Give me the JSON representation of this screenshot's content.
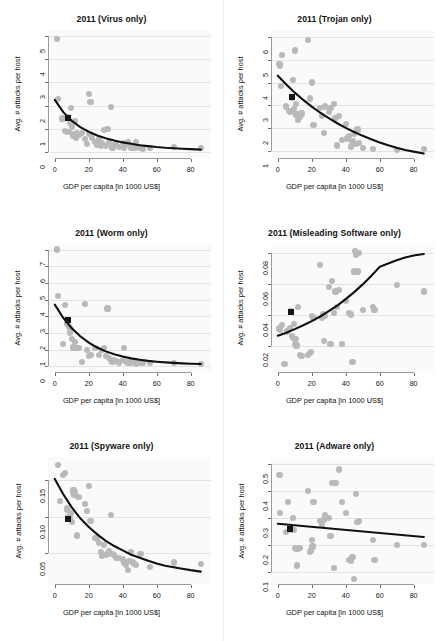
{
  "figure": {
    "rows": 3,
    "cols": 2,
    "point_color": "#b9b9b9",
    "fit_color": "#111111",
    "marker_color": "#161616",
    "grid_color": "#e3e3e3",
    "panel_bg": "#fafafa"
  },
  "common": {
    "xlabel": "GDP per capita [in 1000 US$]",
    "ylabel": "Avg. # attacks per host",
    "xticks": [
      0,
      20,
      40,
      60,
      80
    ],
    "xlim": [
      -4,
      92
    ]
  },
  "chart_data": [
    {
      "type": "scatter",
      "title": "2011 (Virus only)",
      "xlabel": "GDP per capita [in 1000 US$]",
      "ylabel": "Avg. # attacks per host",
      "xlim": [
        -4,
        92
      ],
      "ylim": [
        -0.25,
        5.25
      ],
      "xticks": [
        0,
        20,
        40,
        60,
        80
      ],
      "yticks": [
        0,
        1,
        2,
        3,
        4,
        5
      ],
      "ytick_labels": [
        "0",
        "1",
        "2",
        "3",
        "4",
        "5"
      ],
      "grid": true,
      "legend": "none",
      "x": [
        1.5,
        2.0,
        4.5,
        6.0,
        7.0,
        8.0,
        8.5,
        9.0,
        9.5,
        10.0,
        10.5,
        11.0,
        12.0,
        12.5,
        13.0,
        14.0,
        16.0,
        18.0,
        19.0,
        20.0,
        20.5,
        21.0,
        22.0,
        24.0,
        25.0,
        26.0,
        27.0,
        28.0,
        29.0,
        30.0,
        31.0,
        32.0,
        33.0,
        34.0,
        35.0,
        36.0,
        38.0,
        40.0,
        41.0,
        42.0,
        43.0,
        44.0,
        45.0,
        46.0,
        47.0,
        48.0,
        49.0,
        50.0,
        52.0,
        56.0,
        70.0,
        86.0
      ],
      "y": [
        4.85,
        2.3,
        1.45,
        0.9,
        0.85,
        1.5,
        0.88,
        1.25,
        1.9,
        1.1,
        0.78,
        0.72,
        1.35,
        0.6,
        0.8,
        0.75,
        0.82,
        0.55,
        0.35,
        2.5,
        0.78,
        2.15,
        0.6,
        0.45,
        0.32,
        0.55,
        0.28,
        0.38,
        0.95,
        0.25,
        1.0,
        0.42,
        1.95,
        0.2,
        0.3,
        0.35,
        0.22,
        0.4,
        0.18,
        0.35,
        0.42,
        0.3,
        0.2,
        0.25,
        0.18,
        0.45,
        0.22,
        0.2,
        0.15,
        0.18,
        0.22,
        0.18
      ],
      "marker_point": {
        "x": 8.0,
        "y": 1.45
      },
      "fit_type": "exponential_decay",
      "fit_points": [
        [
          0,
          2.25
        ],
        [
          5,
          1.72
        ],
        [
          10,
          1.35
        ],
        [
          15,
          1.08
        ],
        [
          20,
          0.88
        ],
        [
          25,
          0.72
        ],
        [
          30,
          0.6
        ],
        [
          35,
          0.5
        ],
        [
          40,
          0.42
        ],
        [
          45,
          0.36
        ],
        [
          50,
          0.3
        ],
        [
          55,
          0.26
        ],
        [
          60,
          0.22
        ],
        [
          65,
          0.19
        ],
        [
          70,
          0.17
        ],
        [
          75,
          0.15
        ],
        [
          80,
          0.13
        ],
        [
          86,
          0.11
        ]
      ]
    },
    {
      "type": "scatter",
      "title": "2011 (Trojan only)",
      "xlabel": "GDP per capita [in 1000 US$]",
      "ylabel": "Avg. # attacks per host",
      "xlim": [
        -4,
        92
      ],
      "ylim": [
        0.7,
        6.3
      ],
      "xticks": [
        0,
        20,
        40,
        60,
        80
      ],
      "yticks": [
        1,
        2,
        3,
        4,
        5,
        6
      ],
      "ytick_labels": [
        "1",
        "2",
        "3",
        "4",
        "5",
        "6"
      ],
      "grid": true,
      "legend": "none",
      "x": [
        1.0,
        1.5,
        2.0,
        2.5,
        5.0,
        6.5,
        7.5,
        8.5,
        9.0,
        9.5,
        10.0,
        10.5,
        11.0,
        12.0,
        13.0,
        14.0,
        18.0,
        19.0,
        20.0,
        21.0,
        25.0,
        26.0,
        27.0,
        28.0,
        30.0,
        31.0,
        33.0,
        34.0,
        35.0,
        36.0,
        38.0,
        40.0,
        41.0,
        42.0,
        43.0,
        44.0,
        45.0,
        46.0,
        47.0,
        48.0,
        50.0,
        56.0,
        70.0,
        86.0
      ],
      "y": [
        4.8,
        4.75,
        3.85,
        5.2,
        2.95,
        2.75,
        2.7,
        3.35,
        4.1,
        2.85,
        5.4,
        3.05,
        2.6,
        2.35,
        2.5,
        2.65,
        5.85,
        3.3,
        4.0,
        2.15,
        2.9,
        2.55,
        1.8,
        2.95,
        2.7,
        2.9,
        3.05,
        2.45,
        1.25,
        2.55,
        1.5,
        2.2,
        1.55,
        1.65,
        1.2,
        1.45,
        1.75,
        1.3,
        1.95,
        1.35,
        1.15,
        1.1,
        1.05,
        1.1
      ],
      "marker_point": {
        "x": 8.5,
        "y": 3.35
      },
      "fit_type": "exponential_decay",
      "fit_points": [
        [
          0,
          4.3
        ],
        [
          5,
          3.92
        ],
        [
          10,
          3.56
        ],
        [
          15,
          3.24
        ],
        [
          20,
          2.95
        ],
        [
          25,
          2.68
        ],
        [
          30,
          2.44
        ],
        [
          35,
          2.22
        ],
        [
          40,
          2.02
        ],
        [
          45,
          1.84
        ],
        [
          50,
          1.67
        ],
        [
          55,
          1.52
        ],
        [
          60,
          1.38
        ],
        [
          65,
          1.26
        ],
        [
          70,
          1.15
        ],
        [
          75,
          1.05
        ],
        [
          80,
          0.98
        ],
        [
          86,
          0.9
        ]
      ]
    },
    {
      "type": "scatter",
      "title": "2011 (Worm only)",
      "xlabel": "GDP per capita [in 1000 US$]",
      "ylabel": "Avg. # attacks per host",
      "xlim": [
        -4,
        92
      ],
      "ylim": [
        -0.35,
        7.35
      ],
      "xticks": [
        0,
        20,
        40,
        60,
        80
      ],
      "yticks": [
        0,
        1,
        2,
        3,
        4,
        5,
        6,
        7
      ],
      "ytick_labels": [
        "0",
        "1",
        "2",
        "3",
        "4",
        "5",
        "6",
        "7"
      ],
      "grid": true,
      "legend": "none",
      "x": [
        1.5,
        2.0,
        5.0,
        6.0,
        7.0,
        8.0,
        8.5,
        9.0,
        9.5,
        10.0,
        10.5,
        11.0,
        12.0,
        13.0,
        14.0,
        16.0,
        18.0,
        19.0,
        20.0,
        21.0,
        24.0,
        26.0,
        28.0,
        29.0,
        30.0,
        31.0,
        32.0,
        33.0,
        34.0,
        35.0,
        36.0,
        38.0,
        40.0,
        41.0,
        42.0,
        43.0,
        44.0,
        45.0,
        46.0,
        47.0,
        48.0,
        50.0,
        52.0,
        56.0,
        70.0,
        86.0
      ],
      "y": [
        7.0,
        4.2,
        1.3,
        3.65,
        2.55,
        2.75,
        2.35,
        2.0,
        2.2,
        1.6,
        1.15,
        1.1,
        1.45,
        1.05,
        1.05,
        0.25,
        3.7,
        0.95,
        0.6,
        0.65,
        1.05,
        0.65,
        0.95,
        1.05,
        0.6,
        3.45,
        0.45,
        0.3,
        0.25,
        0.35,
        0.28,
        0.2,
        0.35,
        1.05,
        0.22,
        0.15,
        0.2,
        0.18,
        0.25,
        0.3,
        0.12,
        0.18,
        0.15,
        0.15,
        0.15,
        0.12
      ],
      "marker_point": {
        "x": 8.0,
        "y": 2.75
      },
      "fit_type": "exponential_decay",
      "fit_points": [
        [
          0,
          3.7
        ],
        [
          5,
          2.9
        ],
        [
          10,
          2.28
        ],
        [
          15,
          1.8
        ],
        [
          20,
          1.42
        ],
        [
          25,
          1.12
        ],
        [
          30,
          0.89
        ],
        [
          35,
          0.72
        ],
        [
          40,
          0.58
        ],
        [
          45,
          0.47
        ],
        [
          50,
          0.39
        ],
        [
          55,
          0.32
        ],
        [
          60,
          0.27
        ],
        [
          65,
          0.23
        ],
        [
          70,
          0.2
        ],
        [
          75,
          0.17
        ],
        [
          80,
          0.15
        ],
        [
          86,
          0.13
        ]
      ]
    },
    {
      "type": "scatter",
      "title": "2011 (Misleading Software only)",
      "xlabel": "GDP per capita [in 1000 US$]",
      "ylabel": "Avg. # attacks per host",
      "xlim": [
        -4,
        92
      ],
      "ylim": [
        0.003,
        0.086
      ],
      "xticks": [
        0,
        20,
        40,
        60,
        80
      ],
      "yticks": [
        0.02,
        0.04,
        0.06,
        0.08
      ],
      "ytick_labels": [
        "0.02",
        "0.04",
        "0.06",
        "0.08"
      ],
      "grid": true,
      "legend": "none",
      "x": [
        1.0,
        1.5,
        2.5,
        4.0,
        5.5,
        7.0,
        8.0,
        8.5,
        9.0,
        9.5,
        10.0,
        10.5,
        11.0,
        12.0,
        13.0,
        14.0,
        18.0,
        19.0,
        19.5,
        20.0,
        21.0,
        25.0,
        26.0,
        26.5,
        27.0,
        28.0,
        30.0,
        31.0,
        32.0,
        33.0,
        34.0,
        35.0,
        36.0,
        38.0,
        40.0,
        42.0,
        43.0,
        44.0,
        45.0,
        45.5,
        46.0,
        47.0,
        48.0,
        50.0,
        56.0,
        57.0,
        70.0,
        86.0
      ],
      "y": [
        0.031,
        0.03,
        0.033,
        0.008,
        0.029,
        0.031,
        0.042,
        0.026,
        0.025,
        0.034,
        0.021,
        0.024,
        0.02,
        0.045,
        0.014,
        0.013,
        0.014,
        0.015,
        0.016,
        0.039,
        0.038,
        0.072,
        0.038,
        0.04,
        0.023,
        0.039,
        0.058,
        0.021,
        0.062,
        0.041,
        0.055,
        0.045,
        0.056,
        0.021,
        0.049,
        0.041,
        0.04,
        0.009,
        0.068,
        0.081,
        0.079,
        0.068,
        0.08,
        0.043,
        0.045,
        0.043,
        0.059,
        0.055
      ],
      "marker_point": {
        "x": 8.0,
        "y": 0.042
      },
      "fit_type": "exponential_growth",
      "fit_points": [
        [
          0,
          0.0265
        ],
        [
          5,
          0.0285
        ],
        [
          10,
          0.0308
        ],
        [
          15,
          0.0333
        ],
        [
          20,
          0.036
        ],
        [
          25,
          0.039
        ],
        [
          30,
          0.0424
        ],
        [
          35,
          0.0461
        ],
        [
          40,
          0.0503
        ],
        [
          45,
          0.0548
        ],
        [
          50,
          0.0598
        ],
        [
          55,
          0.0653
        ],
        [
          60,
          0.0712
        ],
        [
          65,
          0.0733
        ],
        [
          70,
          0.0755
        ],
        [
          75,
          0.0772
        ],
        [
          80,
          0.0785
        ],
        [
          86,
          0.0795
        ]
      ]
    },
    {
      "type": "scatter",
      "title": "2011 (Spyware only)",
      "xlabel": "GDP per capita [in 1000 US$]",
      "ylabel": "Avg. # attacks per host",
      "xlim": [
        -4,
        92
      ],
      "ylim": [
        0.008,
        0.182
      ],
      "xticks": [
        0,
        20,
        40,
        60,
        80
      ],
      "yticks": [
        0.05,
        0.1,
        0.15
      ],
      "ytick_labels": [
        "0.05",
        "0.10",
        "0.15"
      ],
      "grid": true,
      "legend": "none",
      "x": [
        2.0,
        3.0,
        5.0,
        6.0,
        7.0,
        7.5,
        8.0,
        8.5,
        9.0,
        9.5,
        10.0,
        10.5,
        11.0,
        11.5,
        12.0,
        13.0,
        14.0,
        18.0,
        19.0,
        20.0,
        21.0,
        24.0,
        25.0,
        26.0,
        27.0,
        28.0,
        29.0,
        30.0,
        31.0,
        32.0,
        33.0,
        34.0,
        35.0,
        36.0,
        38.0,
        40.0,
        41.0,
        42.0,
        43.0,
        44.0,
        45.0,
        46.0,
        47.0,
        48.0,
        50.0,
        51.0,
        56.0,
        70.0,
        86.0
      ],
      "y": [
        0.172,
        0.122,
        0.158,
        0.16,
        0.113,
        0.11,
        0.1,
        0.098,
        0.097,
        0.105,
        0.093,
        0.133,
        0.137,
        0.13,
        0.135,
        0.075,
        0.128,
        0.118,
        0.108,
        0.143,
        0.095,
        0.072,
        0.07,
        0.065,
        0.052,
        0.047,
        0.062,
        0.048,
        0.05,
        0.053,
        0.103,
        0.05,
        0.048,
        0.044,
        0.044,
        0.042,
        0.038,
        0.034,
        0.028,
        0.04,
        0.052,
        0.038,
        0.036,
        0.035,
        0.05,
        0.049,
        0.032,
        0.038,
        0.036
      ],
      "marker_point": {
        "x": 8.0,
        "y": 0.098
      },
      "fit_type": "exponential_decay",
      "fit_points": [
        [
          0,
          0.152
        ],
        [
          5,
          0.131
        ],
        [
          10,
          0.113
        ],
        [
          15,
          0.098
        ],
        [
          20,
          0.086
        ],
        [
          25,
          0.076
        ],
        [
          30,
          0.067
        ],
        [
          35,
          0.06
        ],
        [
          40,
          0.054
        ],
        [
          45,
          0.048
        ],
        [
          50,
          0.044
        ],
        [
          55,
          0.04
        ],
        [
          60,
          0.036
        ],
        [
          65,
          0.033
        ],
        [
          70,
          0.031
        ],
        [
          75,
          0.029
        ],
        [
          80,
          0.027
        ],
        [
          86,
          0.025
        ]
      ]
    },
    {
      "type": "scatter",
      "title": "2011 (Adware only)",
      "xlabel": "GDP per capita [in 1000 US$]",
      "ylabel": "Avg. # attacks per host",
      "xlim": [
        -4,
        92
      ],
      "ylim": [
        0.055,
        0.525
      ],
      "xticks": [
        0,
        20,
        40,
        60,
        80
      ],
      "yticks": [
        0.1,
        0.2,
        0.3,
        0.4,
        0.5
      ],
      "ytick_labels": [
        "0.1",
        "0.2",
        "0.3",
        "0.4",
        "0.5"
      ],
      "grid": true,
      "legend": "none",
      "x": [
        1.0,
        1.5,
        5.0,
        6.0,
        7.0,
        8.0,
        9.0,
        9.5,
        10.0,
        10.5,
        11.0,
        11.5,
        12.0,
        13.0,
        18.0,
        19.0,
        19.5,
        20.0,
        20.5,
        21.0,
        25.0,
        26.0,
        27.0,
        28.0,
        30.0,
        31.0,
        32.0,
        33.0,
        34.0,
        36.0,
        38.0,
        40.0,
        42.0,
        43.0,
        44.0,
        45.0,
        46.0,
        47.0,
        48.0,
        56.0,
        57.0,
        70.0,
        86.0
      ],
      "y": [
        0.46,
        0.32,
        0.25,
        0.36,
        0.26,
        0.255,
        0.3,
        0.255,
        0.19,
        0.185,
        0.19,
        0.125,
        0.185,
        0.19,
        0.4,
        0.175,
        0.18,
        0.22,
        0.195,
        0.36,
        0.29,
        0.275,
        0.295,
        0.31,
        0.3,
        0.235,
        0.43,
        0.115,
        0.43,
        0.48,
        0.36,
        0.32,
        0.145,
        0.14,
        0.155,
        0.075,
        0.39,
        0.285,
        0.29,
        0.22,
        0.145,
        0.2,
        0.2
      ],
      "marker_point": {
        "x": 7.0,
        "y": 0.26
      },
      "fit_type": "linear",
      "fit_points": [
        [
          0,
          0.278
        ],
        [
          86,
          0.229
        ]
      ]
    }
  ]
}
